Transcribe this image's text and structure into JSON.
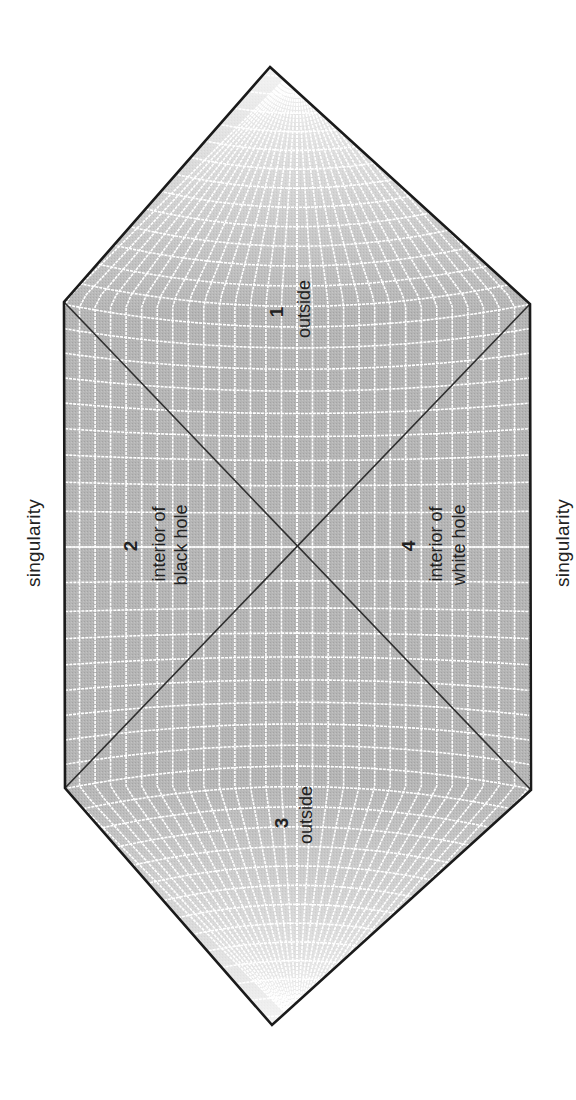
{
  "diagram": {
    "orientation": "rotated -90deg",
    "colors": {
      "fill": "#b3b3b3",
      "grid": "#ffffff",
      "outline": "#1a1a1a",
      "horizon": "#2e2e2e",
      "text": "#222222",
      "background": "#ffffff"
    },
    "shape": {
      "top_vertex": [
        270,
        67
      ],
      "upper_left": [
        64,
        302
      ],
      "upper_right": [
        530,
        304
      ],
      "lower_right": [
        531,
        790
      ],
      "lower_left": [
        65,
        788
      ],
      "bottom_vertex": [
        272,
        1025
      ],
      "center": [
        297,
        547
      ]
    },
    "horizons": [
      {
        "from": [
          64,
          302
        ],
        "to": [
          531,
          790
        ]
      },
      {
        "from": [
          530,
          304
        ],
        "to": [
          65,
          788
        ]
      }
    ],
    "grid": {
      "vertical_lines": 15,
      "horizontal_lines": 22
    }
  },
  "labels": {
    "singularity_left": "singularity",
    "singularity_right": "singularity",
    "regions": [
      {
        "number": "1",
        "line1": "outside",
        "line2": ""
      },
      {
        "number": "2",
        "line1": "interior of",
        "line2": "black hole"
      },
      {
        "number": "3",
        "line1": "outside",
        "line2": ""
      },
      {
        "number": "4",
        "line1": "interior of",
        "line2": "white hole"
      }
    ]
  }
}
